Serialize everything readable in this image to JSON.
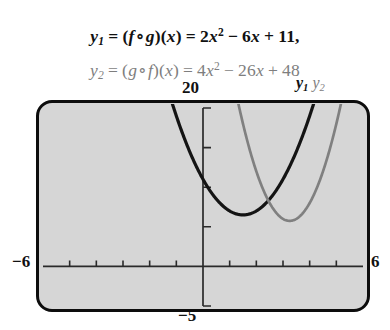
{
  "equations": {
    "line1": {
      "lhs_var": "y",
      "lhs_sub": "1",
      "composition": "(f∘g)(x)",
      "expression": "2x² − 6x + 11,",
      "color": "#111111",
      "plain": "y₁ = (f∘g)(x) = 2x² − 6x + 11,",
      "parts": {
        "eq1": "=",
        "open": "(",
        "f": "f",
        "ring": "∘",
        "g": "g",
        "close": ")(",
        "xclose": "x",
        "paren2": ")",
        "eq2": "=",
        "coef": "2",
        "xv": "x",
        "pow": "2",
        "minus": "−",
        "bterm": "6",
        "xb": "x",
        "plus": "+",
        "cterm": "11,"
      }
    },
    "line2": {
      "lhs_var": "y",
      "lhs_sub": "2",
      "composition": "(g∘f)(x)",
      "expression": "4x² − 26x + 48",
      "color": "#7e7e7e",
      "plain": "y₂ = (g∘f)(x) = 4x² − 26x + 48",
      "parts": {
        "eq1": "=",
        "open": "(",
        "f": "g",
        "ring": "∘",
        "g": "f",
        "close": ")(",
        "xclose": "x",
        "paren2": ")",
        "eq2": "=",
        "coef": "4",
        "xv": "x",
        "pow": "2",
        "minus": "−",
        "bterm": "26",
        "xb": "x",
        "plus": "+",
        "cterm": "48"
      }
    }
  },
  "window_labels": {
    "ymax": "20",
    "ymin": "−5",
    "xmin": "−6",
    "xmax": "6"
  },
  "curve_labels": {
    "y1_var": "y",
    "y1_sub": "1",
    "y2_var": "y",
    "y2_sub": "2"
  },
  "colors": {
    "screen_fill": "#d6d6d6",
    "screen_border": "#0d0d0d",
    "curve_y1": "#141414",
    "curve_y2": "#808080",
    "axis": "#2a2a2a",
    "text_primary": "#111111",
    "text_secondary": "#7e7e7e"
  },
  "chart_data": {
    "type": "line",
    "title": "",
    "xlabel": "",
    "ylabel": "",
    "xlim": [
      -6,
      6
    ],
    "ylim": [
      -5,
      20
    ],
    "xscl": 1,
    "yscl": 5,
    "grid": false,
    "legend": "top-right",
    "series": [
      {
        "name": "y₁",
        "label": "(f∘g)(x) = 2x² − 6x + 11",
        "color": "#141414",
        "type": "parabola",
        "a": 2,
        "b": -6,
        "c": 11,
        "vertex": [
          1.5,
          6.5
        ],
        "x": [
          -0.6,
          -0.3,
          0.0,
          0.5,
          1.0,
          1.5,
          2.0,
          2.5,
          3.0,
          3.4,
          3.8,
          4.1
        ],
        "values": [
          15.32,
          12.98,
          11.0,
          8.5,
          7.0,
          6.5,
          7.0,
          8.5,
          11.0,
          13.72,
          17.08,
          19.99
        ]
      },
      {
        "name": "y₂",
        "label": "(g∘f)(x) = 4x² − 26x + 48",
        "color": "#808080",
        "type": "parabola",
        "a": 4,
        "b": -26,
        "c": 48,
        "vertex": [
          3.25,
          5.75
        ],
        "x": [
          1.35,
          1.6,
          2.0,
          2.4,
          2.8,
          3.25,
          3.7,
          4.1,
          4.5,
          4.9,
          5.15
        ],
        "values": [
          20.19,
          16.64,
          12.0,
          8.64,
          6.56,
          5.75,
          6.56,
          8.64,
          12.0,
          16.64,
          20.19
        ]
      }
    ],
    "axes": {
      "x_axis_y": 0,
      "y_axis_x": 0,
      "x_ticks": [
        -5,
        -4,
        -3,
        -2,
        -1,
        1,
        2,
        3,
        4,
        5
      ],
      "y_ticks": [
        -5,
        5,
        10,
        15,
        20
      ]
    }
  }
}
